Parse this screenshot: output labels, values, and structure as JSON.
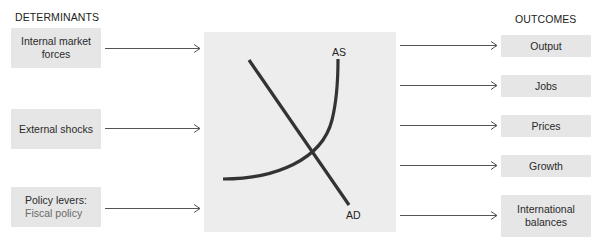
{
  "headings": {
    "left": "DETERMINANTS",
    "right": "OUTCOMES"
  },
  "determinants": [
    {
      "label": "Internal market forces",
      "line1": "Internal market",
      "line2": "forces"
    },
    {
      "label": "External shocks",
      "line1": "External shocks"
    },
    {
      "label": "Policy levers: Fiscal policy",
      "line1": "Policy levers:",
      "line2": "Fiscal policy"
    }
  ],
  "outcomes": [
    {
      "line1": "Output"
    },
    {
      "line1": "Jobs"
    },
    {
      "line1": "Prices"
    },
    {
      "line1": "Growth"
    },
    {
      "line1": "International",
      "line2": "balances"
    }
  ],
  "graph": {
    "supply_label": "AS",
    "demand_label": "AD"
  },
  "colors": {
    "box_fill": "#e6e6e6",
    "center_fill": "#ededed",
    "curve": "#333333",
    "arrow": "#555555",
    "subtext": "#6a6a6a"
  }
}
